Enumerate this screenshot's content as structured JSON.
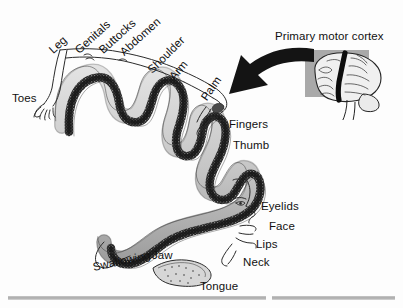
{
  "figure": {
    "background_color": "#fdfdfd",
    "ink_color": "#111111",
    "band_light_color": "#c9c9c9",
    "band_dark_color": "#1c1c1c",
    "inset_background_color": "#a9a9a9",
    "rule_color": "#a8a8a8"
  },
  "callout": {
    "label": "Primary motor cortex",
    "inset_name": "lateral-brain-view"
  },
  "labels": {
    "toes": "Toes",
    "leg": "Leg",
    "genitals": "Genitals",
    "buttocks": "Buttocks",
    "abdomen": "Abdomen",
    "shoulder": "Shoulder",
    "arm": "Arm",
    "palm": "Palm",
    "fingers": "Fingers",
    "thumb": "Thumb",
    "eyelids": "Eyelids",
    "face": "Face",
    "lips": "Lips",
    "neck": "Neck",
    "jaw": "Jaw",
    "swallowing": "Swallowing",
    "tongue": "Tongue"
  },
  "label_layout": [
    {
      "key": "toes",
      "x": 12,
      "y": 93,
      "rotate": 0,
      "size": 11.5
    },
    {
      "key": "leg",
      "x": 51,
      "y": 46,
      "rotate": -42,
      "size": 11.5
    },
    {
      "key": "genitals",
      "x": 77,
      "y": 46,
      "rotate": -42,
      "size": 11.5
    },
    {
      "key": "buttocks",
      "x": 101,
      "y": 46,
      "rotate": -42,
      "size": 11.5
    },
    {
      "key": "abdomen",
      "x": 122,
      "y": 48,
      "rotate": -42,
      "size": 11.5
    },
    {
      "key": "shoulder",
      "x": 150,
      "y": 66,
      "rotate": -45,
      "size": 11.5
    },
    {
      "key": "arm",
      "x": 172,
      "y": 73,
      "rotate": -50,
      "size": 11.5
    },
    {
      "key": "palm",
      "x": 204,
      "y": 94,
      "rotate": -55,
      "size": 11.5
    },
    {
      "key": "fingers",
      "x": 229,
      "y": 119,
      "rotate": 0,
      "size": 11.5
    },
    {
      "key": "thumb",
      "x": 233,
      "y": 140,
      "rotate": 0,
      "size": 11.5
    },
    {
      "key": "eyelids",
      "x": 261,
      "y": 201,
      "rotate": 0,
      "size": 11.5
    },
    {
      "key": "face",
      "x": 269,
      "y": 221,
      "rotate": 0,
      "size": 11.5
    },
    {
      "key": "lips",
      "x": 256,
      "y": 239,
      "rotate": 0,
      "size": 11.5
    },
    {
      "key": "neck",
      "x": 243,
      "y": 257,
      "rotate": 0,
      "size": 11.5
    },
    {
      "key": "jaw",
      "x": 152,
      "y": 250,
      "rotate": 0,
      "size": 11.5
    },
    {
      "key": "swallowing",
      "x": 93,
      "y": 262,
      "rotate": -12,
      "size": 11.5
    },
    {
      "key": "tongue",
      "x": 200,
      "y": 281,
      "rotate": 0,
      "size": 11.5
    }
  ]
}
